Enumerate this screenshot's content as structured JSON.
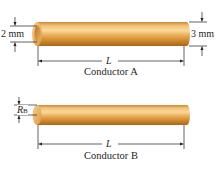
{
  "figure": {
    "conductor_a": {
      "caption": "Conductor A",
      "inner_diameter_label": "2 mm",
      "outer_diameter_label": "3 mm",
      "length_label": "L",
      "shape": "hollow-tube"
    },
    "conductor_b": {
      "caption": "Conductor B",
      "radius_label": "R",
      "radius_subscript": "B",
      "length_label": "L",
      "shape": "solid-cylinder"
    },
    "colors": {
      "copper_light": "#f7c978",
      "copper_mid": "#e9a54a",
      "copper_dark": "#b8741f",
      "line": "#231f20"
    }
  }
}
